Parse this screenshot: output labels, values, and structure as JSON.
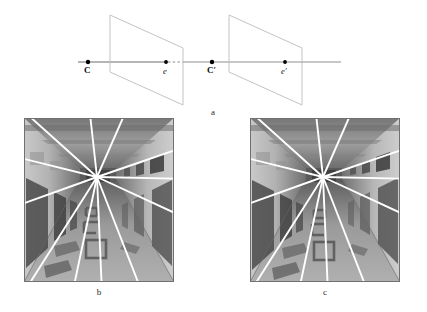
{
  "figure": {
    "caption_a": "a",
    "caption_b": "b",
    "caption_c": "c"
  },
  "diagram": {
    "label_camera_center_left": "C",
    "label_epipole_left": "e",
    "label_camera_center_right": "C′",
    "label_epipole_right": "e′",
    "baseline_color": "#6b6b6b",
    "plane_color": "#b9b9b9",
    "point_color": "#000000",
    "points": [
      {
        "name": "C",
        "x": 88,
        "y": 62
      },
      {
        "name": "e",
        "x": 166,
        "y": 62
      },
      {
        "name": "C'",
        "x": 212,
        "y": 62
      },
      {
        "name": "e'",
        "x": 285,
        "y": 62
      }
    ],
    "image_plane_left": {
      "x1": 110,
      "y1": 15,
      "x2": 183,
      "y2": 48,
      "x3": 183,
      "y3": 105,
      "x4": 110,
      "y4": 72
    },
    "image_plane_right": {
      "x1": 229,
      "y1": 15,
      "x2": 302,
      "y2": 48,
      "x3": 302,
      "y3": 105,
      "x4": 229,
      "y4": 72
    },
    "baseline": {
      "x1": 78,
      "y1": 62,
      "x2": 341,
      "y2": 62
    }
  },
  "photo_left": {
    "title": "corridor-view-left",
    "epipole": {
      "x": 73,
      "y": 59
    },
    "border_color": "#6f6f6f",
    "line_color": "#ffffff",
    "scene": "indoor corridor with doors, ceiling beams and floor markings"
  },
  "photo_right": {
    "title": "corridor-view-right",
    "epipole": {
      "x": 73,
      "y": 59
    },
    "border_color": "#6f6f6f",
    "line_color": "#ffffff",
    "scene": "indoor corridor with doors, ceiling beams and floor markings"
  },
  "colors": {
    "background": "#ffffff",
    "ink": "#111111",
    "epipolar_line": "#ffffff",
    "plane_stroke": "#b9b9b9"
  }
}
